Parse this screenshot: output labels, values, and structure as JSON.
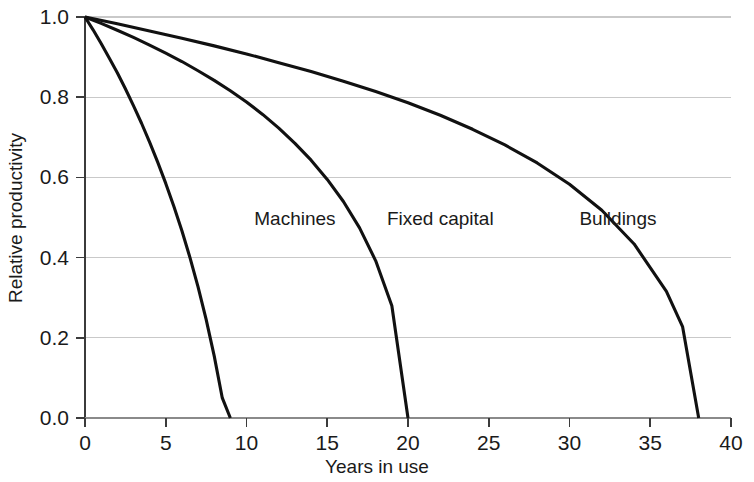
{
  "chart_data": {
    "type": "line",
    "title": "",
    "xlabel": "Years in use",
    "ylabel": "Relative productivity",
    "xlim": [
      0,
      40
    ],
    "ylim": [
      0.0,
      1.0
    ],
    "xticks": [
      0,
      5,
      10,
      15,
      20,
      25,
      30,
      35,
      40
    ],
    "xtick_labels": [
      "0",
      "5",
      "10",
      "15",
      "20",
      "25",
      "30",
      "35",
      "40"
    ],
    "yticks": [
      0.0,
      0.2,
      0.4,
      0.6,
      0.8,
      1.0
    ],
    "ytick_labels": [
      "0.0",
      "0.2",
      "0.4",
      "0.6",
      "0.8",
      "1.0"
    ],
    "grid": "horizontal",
    "grid_color": "#c9c9c9",
    "line_color": "#111111",
    "background_color": "#ffffff",
    "legend": "inline-labels",
    "series": [
      {
        "name": "Machines",
        "label_x": 13.0,
        "label_y": 0.5,
        "lifetime": 9,
        "x": [
          0,
          0.5,
          1,
          1.5,
          2,
          2.5,
          3,
          3.5,
          4,
          4.5,
          5,
          5.5,
          6,
          6.5,
          7,
          7.5,
          8,
          8.5,
          9
        ],
        "y": [
          1.0,
          0.968,
          0.934,
          0.898,
          0.861,
          0.821,
          0.779,
          0.735,
          0.688,
          0.638,
          0.585,
          0.528,
          0.467,
          0.4,
          0.327,
          0.246,
          0.155,
          0.05,
          0.0
        ]
      },
      {
        "name": "Fixed capital",
        "label_x": 22.0,
        "label_y": 0.5,
        "lifetime": 20,
        "x": [
          0,
          1,
          2,
          3,
          4,
          5,
          6,
          7,
          8,
          9,
          10,
          11,
          12,
          13,
          14,
          15,
          16,
          17,
          18,
          19,
          20
        ],
        "y": [
          1.0,
          0.984,
          0.967,
          0.949,
          0.93,
          0.91,
          0.889,
          0.866,
          0.842,
          0.816,
          0.788,
          0.757,
          0.723,
          0.685,
          0.643,
          0.595,
          0.54,
          0.474,
          0.392,
          0.28,
          0.0
        ]
      },
      {
        "name": "Buildings",
        "label_x": 33.0,
        "label_y": 0.5,
        "lifetime": 38,
        "x": [
          0,
          2,
          4,
          6,
          8,
          10,
          12,
          14,
          16,
          18,
          20,
          22,
          24,
          26,
          28,
          30,
          32,
          34,
          36,
          37,
          38
        ],
        "y": [
          1.0,
          0.983,
          0.965,
          0.947,
          0.928,
          0.908,
          0.886,
          0.864,
          0.84,
          0.814,
          0.786,
          0.755,
          0.72,
          0.681,
          0.636,
          0.583,
          0.518,
          0.434,
          0.316,
          0.228,
          0.0
        ]
      }
    ]
  },
  "axis": {
    "x_title": "Years in use",
    "y_title": "Relative productivity"
  }
}
